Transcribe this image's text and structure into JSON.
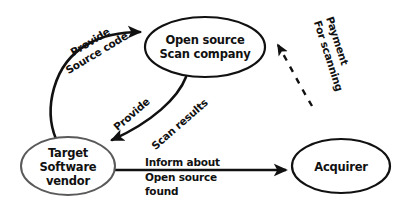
{
  "diagram": {
    "background_color": "#ffffff",
    "stroke_color": "#111111",
    "target_node_stroke_color": "#5a5a5a",
    "text_color": "#111111",
    "nodes": [
      {
        "id": "open-source-scan-company",
        "name": "open-source-scan-company-node",
        "lines": [
          "Open source",
          "Scan company"
        ],
        "cx": 205,
        "cy": 47,
        "rx": 60,
        "ry": 30,
        "stroke": "#111111",
        "stroke_width": 2.2
      },
      {
        "id": "target-software-vendor",
        "name": "target-software-vendor-node",
        "lines": [
          "Target",
          "Software",
          "vendor"
        ],
        "cx": 68,
        "cy": 166,
        "rx": 47,
        "ry": 29,
        "stroke": "#5a5a5a",
        "stroke_width": 2.0
      },
      {
        "id": "acquirer",
        "name": "acquirer-node",
        "lines": [
          "Acquirer"
        ],
        "cx": 341,
        "cy": 166,
        "rx": 49,
        "ry": 27,
        "stroke": "#111111",
        "stroke_width": 2.2
      }
    ],
    "edges": [
      {
        "id": "provide-source-code",
        "name": "edge-provide-source-code",
        "from": "target-software-vendor",
        "to": "open-source-scan-company",
        "style": "solid",
        "label_lines": [
          "Provide",
          "Source code"
        ],
        "label_rotation": -31,
        "label_x": 92,
        "label_y": 45
      },
      {
        "id": "provide-scan-results",
        "name": "edge-provide-scan-results",
        "from": "open-source-scan-company",
        "to": "target-software-vendor",
        "style": "solid",
        "label_lines": [
          "Provide",
          "Scan results"
        ],
        "label_left": "Provide",
        "label_right": "Scan results",
        "label_rotation": -41,
        "label_left_x": 134,
        "label_left_y": 117,
        "label_right_x": 180,
        "label_right_y": 125
      },
      {
        "id": "payment-for-scanning",
        "name": "edge-payment-for-scanning",
        "from": "acquirer",
        "to": "open-source-scan-company",
        "style": "dashed",
        "label_lines": [
          "Payment",
          "For scanning"
        ],
        "label_rotation": 72,
        "label_x": 330,
        "label_y": 20
      },
      {
        "id": "inform-about-open-source-found",
        "name": "edge-inform-about-open-source-found",
        "from": "target-software-vendor",
        "to": "acquirer",
        "style": "solid",
        "label_lines": [
          "Inform about",
          "Open source",
          "found"
        ],
        "label_rotation": 0,
        "label_x": 145,
        "label_y": 165
      }
    ]
  }
}
